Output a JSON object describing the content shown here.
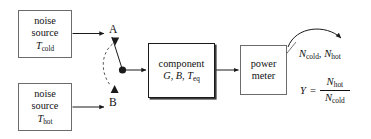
{
  "diagram": {
    "type": "block-diagram",
    "stroke_color": "#1a1a1a",
    "box_border_color": "#6b6b6b",
    "background": "#ffffff",
    "boxes": [
      {
        "id": "noise-source-cold",
        "lines": [
          "noise",
          "source"
        ],
        "symbol": "T",
        "symbol_sub": "cold"
      },
      {
        "id": "noise-source-hot",
        "lines": [
          "noise",
          "source"
        ],
        "symbol": "T",
        "symbol_sub": "hot"
      },
      {
        "id": "component",
        "lines": [
          "component"
        ],
        "params": [
          "G",
          "B"
        ],
        "param_symbol": "T",
        "param_sub": "eq"
      },
      {
        "id": "power-meter",
        "lines": [
          "power",
          "meter"
        ]
      }
    ],
    "switch": {
      "port_a_label": "A",
      "port_b_label": "B",
      "dashed_arc": true,
      "pivot": true
    },
    "output": {
      "measured_values_prefix": "N",
      "measured_values": [
        {
          "symbol": "N",
          "sub": "cold"
        },
        {
          "symbol": "N",
          "sub": "hot"
        }
      ],
      "separator": ",",
      "equation": {
        "lhs": "Y",
        "equals": "=",
        "numerator": {
          "symbol": "N",
          "sub": "hot"
        },
        "denominator": {
          "symbol": "N",
          "sub": "cold"
        }
      }
    }
  }
}
